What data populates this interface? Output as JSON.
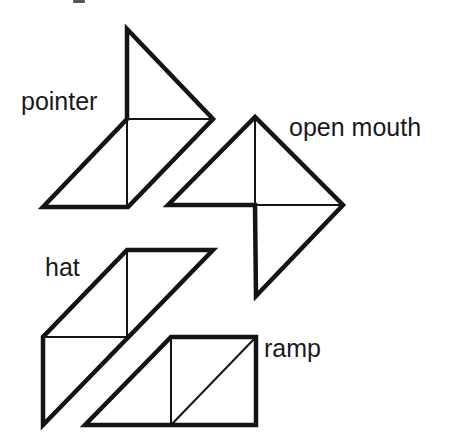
{
  "figure": {
    "colors": {
      "stroke": "#141414",
      "text": "#1a1a1a",
      "background": "#ffffff"
    },
    "shapes": [
      {
        "id": "pointer",
        "label": "pointer",
        "label_pos": [
          21,
          110
        ],
        "outline": "M127,29 L213,119 L128,207 L43,207 L127,119 Z",
        "inner_lines": [
          "M127,119 L213,119",
          "M127,119 L127,207"
        ]
      },
      {
        "id": "open-mouth",
        "label": "open mouth",
        "label_pos": [
          289,
          136
        ],
        "outline": "M255,117 L168,205 L255,205 L256,296 L343,205 Z",
        "inner_lines": [
          "M255,117 L255,205",
          "M255,205 L343,205"
        ]
      },
      {
        "id": "hat",
        "label": "hat",
        "label_pos": [
          45,
          276
        ],
        "outline": "M127,250 L213,250 L43,425 L43,337 Z",
        "inner_lines": [
          "M127,250 L127,337",
          "M43,337 L127,337"
        ]
      },
      {
        "id": "ramp",
        "label": "ramp",
        "label_pos": [
          264,
          357
        ],
        "outline": "M171,337 L256,337 L256,425 L85,425 Z",
        "inner_lines": [
          "M171,337 L171,425",
          "M171,425 L256,337"
        ]
      }
    ]
  }
}
